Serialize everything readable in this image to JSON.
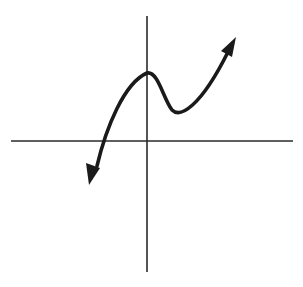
{
  "diagram": {
    "colors": {
      "background": "#ffffff",
      "axes": "#2a2a2a",
      "curve": "#1a1a1a"
    },
    "axes": {
      "x_axis": {
        "y": 141,
        "x_start": 11,
        "x_end": 293
      },
      "y_axis": {
        "x": 147,
        "y_start": 16,
        "y_end": 272
      },
      "labels": []
    },
    "curve": {
      "path": "M 97 166 C 106 128, 124 83, 147 73 C 158 71, 163 98, 172 110 C 180 118, 200 108, 228 52",
      "features": {
        "left_end_arrow_tip": [
          90,
          184
        ],
        "x_intercept": [
          103,
          141
        ],
        "local_maximum_on_y_axis": [
          147,
          73
        ],
        "local_minimum": [
          176,
          113
        ],
        "right_end_arrow_tip": [
          235,
          38
        ]
      },
      "arrowheads": [
        {
          "name": "left-arrowhead",
          "points": "89,185 86,163 100,168"
        },
        {
          "name": "right-arrowhead",
          "points": "236,37 221,51 232,57"
        }
      ]
    }
  }
}
